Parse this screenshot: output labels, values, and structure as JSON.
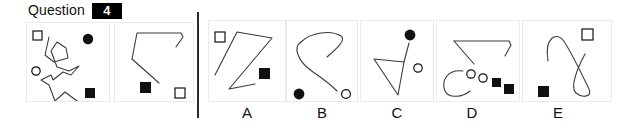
{
  "header": {
    "question_word": "Question",
    "question_number": "4"
  },
  "divider": {
    "name": "vertical-divider",
    "color": "#2b2b2b"
  },
  "colors": {
    "ink": "#111111",
    "stroke": "#3a3a3a",
    "panel_border": "#eceaea",
    "badge_bg": "#000000",
    "badge_fg": "#ffffff",
    "filled": "#111111",
    "open_fill": "#ffffff"
  },
  "stimulus_panels": [
    {
      "id": "stimulus-1",
      "shapes": [
        {
          "kind": "open-square",
          "x": 10,
          "y": 12
        },
        {
          "kind": "filled-circle",
          "x": 57,
          "y": 16
        },
        {
          "kind": "open-circle",
          "x": 9,
          "y": 48
        },
        {
          "kind": "filled-square",
          "x": 61,
          "y": 72
        },
        {
          "kind": "polyline-squiggle"
        }
      ]
    },
    {
      "id": "stimulus-2",
      "shapes": [
        {
          "kind": "filled-square",
          "x": 28,
          "y": 62
        },
        {
          "kind": "open-square",
          "x": 62,
          "y": 74
        },
        {
          "kind": "polyline-angular"
        }
      ]
    }
  ],
  "options": [
    {
      "id": "option-a",
      "label": "A",
      "shapes": [
        {
          "kind": "open-square",
          "x": 8,
          "y": 16
        },
        {
          "kind": "filled-square",
          "x": 54,
          "y": 52
        },
        {
          "kind": "polyline-zigzag"
        }
      ]
    },
    {
      "id": "option-b",
      "label": "B",
      "shapes": [
        {
          "kind": "filled-circle",
          "x": 10,
          "y": 75
        },
        {
          "kind": "open-circle",
          "x": 60,
          "y": 75
        },
        {
          "kind": "curve-hook"
        }
      ]
    },
    {
      "id": "option-c",
      "label": "C",
      "shapes": [
        {
          "kind": "filled-circle",
          "x": 50,
          "y": 12
        },
        {
          "kind": "open-circle",
          "x": 60,
          "y": 48
        },
        {
          "kind": "triangle-open"
        }
      ]
    },
    {
      "id": "option-d",
      "label": "D",
      "shapes": [
        {
          "kind": "open-circle",
          "x": 26,
          "y": 55
        },
        {
          "kind": "open-circle",
          "x": 38,
          "y": 59
        },
        {
          "kind": "filled-square",
          "x": 50,
          "y": 62
        },
        {
          "kind": "filled-square",
          "x": 62,
          "y": 69
        },
        {
          "kind": "polyline-angular"
        },
        {
          "kind": "curve-c"
        }
      ]
    },
    {
      "id": "option-e",
      "label": "E",
      "shapes": [
        {
          "kind": "open-square",
          "x": 58,
          "y": 10
        },
        {
          "kind": "filled-square",
          "x": 17,
          "y": 70
        },
        {
          "kind": "curve-s"
        }
      ]
    }
  ]
}
